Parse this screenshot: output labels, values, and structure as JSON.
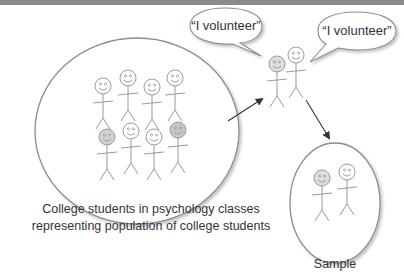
{
  "diagram": {
    "population": {
      "caption_line1": "College students in psychology classes",
      "caption_line2": "representing population of college students",
      "figure_count": 8,
      "highlighted_figures": [
        5,
        8
      ]
    },
    "volunteers": {
      "bubble1_text": "“I volunteer”",
      "bubble2_text": "“I volunteer”",
      "figure_count": 2
    },
    "sample": {
      "label": "Sample",
      "figure_count": 2
    },
    "colors": {
      "stroke": "#999999",
      "highlight_face": "#cfcfcf",
      "arrow": "#333333",
      "top_band": "#8a8a8a"
    }
  }
}
